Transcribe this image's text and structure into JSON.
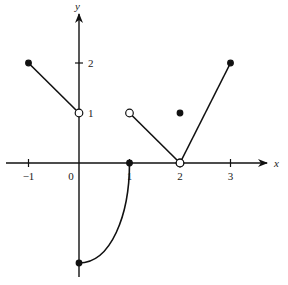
{
  "chart_data": {
    "type": "line",
    "title": "",
    "xlabel": "x",
    "ylabel": "y",
    "xlim": [
      -1.3,
      3.8
    ],
    "ylim": [
      -2.3,
      3.2
    ],
    "grid": false,
    "x_ticks": [
      {
        "value": -1,
        "label": "−1"
      },
      {
        "value": 0,
        "label": "0"
      },
      {
        "value": 1,
        "label": "1"
      },
      {
        "value": 2,
        "label": "2"
      },
      {
        "value": 3,
        "label": "3"
      }
    ],
    "y_ticks": [
      {
        "value": 1,
        "label": "1"
      },
      {
        "value": 2,
        "label": "2"
      }
    ],
    "series": [
      {
        "name": "segment-1",
        "kind": "line",
        "points": [
          [
            -1,
            2
          ],
          [
            0,
            1
          ]
        ],
        "endpoints": [
          {
            "x": -1,
            "y": 2,
            "style": "closed"
          },
          {
            "x": 0,
            "y": 1,
            "style": "open"
          }
        ]
      },
      {
        "name": "curve-2",
        "kind": "curve",
        "points": [
          [
            0,
            -2
          ],
          [
            0.5,
            -1.5
          ],
          [
            0.85,
            -0.8
          ],
          [
            1,
            0
          ]
        ],
        "endpoints": [
          {
            "x": 0,
            "y": -2,
            "style": "closed"
          },
          {
            "x": 1,
            "y": 0,
            "style": "closed"
          }
        ]
      },
      {
        "name": "segment-3",
        "kind": "line",
        "points": [
          [
            1,
            1
          ],
          [
            2,
            0
          ]
        ],
        "endpoints": [
          {
            "x": 1,
            "y": 1,
            "style": "open"
          },
          {
            "x": 2,
            "y": 0,
            "style": "open"
          }
        ]
      },
      {
        "name": "isolated-point",
        "kind": "point",
        "points": [
          [
            2,
            1
          ]
        ],
        "endpoints": [
          {
            "x": 2,
            "y": 1,
            "style": "closed"
          }
        ]
      },
      {
        "name": "segment-4",
        "kind": "line",
        "points": [
          [
            2,
            0
          ],
          [
            3,
            2
          ]
        ],
        "endpoints": [
          {
            "x": 2,
            "y": 0,
            "style": "open"
          },
          {
            "x": 3,
            "y": 2,
            "style": "closed"
          }
        ]
      }
    ]
  }
}
